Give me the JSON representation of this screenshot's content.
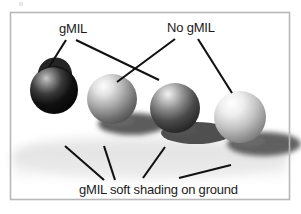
{
  "figure": {
    "type": "illustration-diagram",
    "background_color": "#ffffff",
    "border_color": "#b8b8b8",
    "frame": {
      "x": 10,
      "y": 12,
      "width": 280,
      "height": 188
    },
    "labels": {
      "gmil": "gMIL",
      "no_gmil": "No gMIL",
      "ground": "gMIL soft shading on ground"
    },
    "spheres": [
      {
        "id": "sphere-1",
        "cx": 54,
        "cy": 90,
        "r": 24,
        "shading": "hard",
        "annotated_by": "gMIL",
        "fill_light": "#8f8f8f",
        "fill_dark": "#0d0d0d",
        "shadow": null
      },
      {
        "id": "sphere-2",
        "cx": 112,
        "cy": 99,
        "r": 25,
        "shading": "soft",
        "annotated_by": "gMIL",
        "fill_light": "#f2f2f2",
        "fill_dark": "#4e4e4e",
        "shadow": {
          "cx": 132,
          "cy": 124,
          "rx": 34,
          "ry": 11,
          "soft": true
        }
      },
      {
        "id": "sphere-3",
        "cx": 175,
        "cy": 108,
        "r": 25,
        "shading": "hard",
        "annotated_by": "No gMIL",
        "fill_light": "#e8e8e8",
        "fill_dark": "#2a2a2a",
        "shadow": {
          "cx": 196,
          "cy": 133,
          "rx": 35,
          "ry": 11,
          "soft": false
        }
      },
      {
        "id": "sphere-4",
        "cx": 240,
        "cy": 117,
        "r": 26,
        "shading": "soft",
        "annotated_by": "No gMIL",
        "fill_light": "#fbfbfb",
        "fill_dark": "#6a6a6a",
        "shadow": {
          "cx": 262,
          "cy": 143,
          "rx": 37,
          "ry": 12,
          "soft": true
        }
      }
    ],
    "leader_lines": [
      {
        "id": "leader-gmil-a",
        "from_label": "gMIL",
        "x1": 66,
        "y1": 40,
        "x2": 49,
        "y2": 67
      },
      {
        "id": "leader-gmil-b",
        "from_label": "gMIL",
        "x1": 75,
        "y1": 40,
        "x2": 158,
        "y2": 80
      },
      {
        "id": "leader-nogmil-a",
        "from_label": "No gMIL",
        "x1": 176,
        "y1": 39,
        "x2": 118,
        "y2": 82
      },
      {
        "id": "leader-nogmil-b",
        "from_label": "No gMIL",
        "x1": 197,
        "y1": 39,
        "x2": 231,
        "y2": 92
      },
      {
        "id": "leader-ground-a",
        "from_label": "ground",
        "x1": 104,
        "y1": 180,
        "x2": 65,
        "y2": 146
      },
      {
        "id": "leader-ground-b",
        "from_label": "ground",
        "x1": 115,
        "y1": 180,
        "x2": 104,
        "y2": 146
      },
      {
        "id": "leader-ground-c",
        "from_label": "ground",
        "x1": 143,
        "y1": 178,
        "x2": 164,
        "y2": 147
      },
      {
        "id": "leader-ground-d",
        "from_label": "ground",
        "x1": 178,
        "y1": 178,
        "x2": 230,
        "y2": 165
      }
    ],
    "ground_haze": {
      "color": "#d8d8d8",
      "description": "soft gray ground shading band"
    }
  }
}
